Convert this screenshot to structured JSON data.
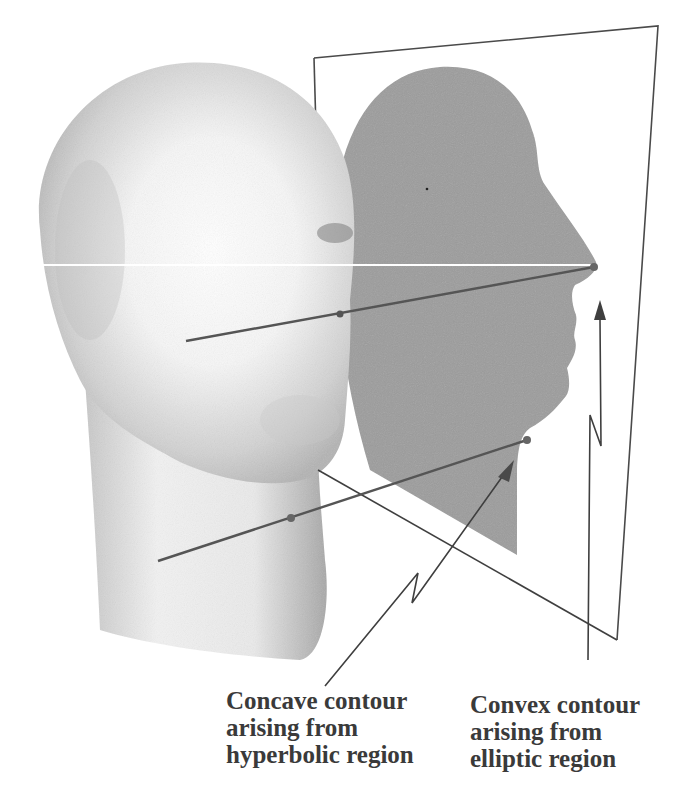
{
  "figure": {
    "colors": {
      "background": "#ffffff",
      "head_light": "#f4f4f4",
      "head_shade": "#b8b8b8",
      "silhouette": "#9a9a9a",
      "lines": "#4a4a4a",
      "label_text": "#3a3a3a"
    }
  },
  "labels": {
    "concave": {
      "line1": "Concave contour",
      "line2": "arising from",
      "line3": "hyperbolic region"
    },
    "convex": {
      "line1": "Convex contour",
      "line2": "arising from",
      "line3": "elliptic region"
    }
  }
}
